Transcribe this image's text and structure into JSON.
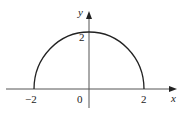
{
  "figure": {
    "axes": {
      "x_label": "x",
      "y_label": "y",
      "origin_label": "0"
    },
    "ticks": {
      "x_neg": "−2",
      "x_pos": "2",
      "y_top": "2"
    },
    "curve": {
      "type": "semicircle",
      "center": [
        0,
        0
      ],
      "radius": 2,
      "x_range": [
        -2,
        2
      ],
      "color": "#222222"
    },
    "axis_color": "#555555"
  }
}
